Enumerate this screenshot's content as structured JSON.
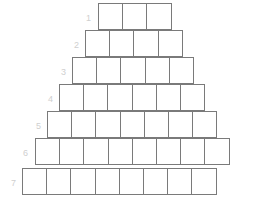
{
  "figure": {
    "kind": "brick-pyramid-grid",
    "background_color": "#ffffff",
    "cell_border_color": "#7a7a7a",
    "label_color": "#cfcfcf",
    "cell_width": 25.2,
    "cell_height": 27,
    "total_rows": 7,
    "total_cells": 41
  },
  "rows": [
    {
      "label": "1",
      "cells": 3,
      "left": 98,
      "top": 3,
      "label_x": 86,
      "label_y": 14
    },
    {
      "label": "2",
      "cells": 4,
      "left": 85,
      "top": 30,
      "label_x": 74,
      "label_y": 41
    },
    {
      "label": "3",
      "cells": 5,
      "left": 72,
      "top": 57,
      "label_x": 61,
      "label_y": 68
    },
    {
      "label": "4",
      "cells": 6,
      "left": 59,
      "top": 84,
      "label_x": 48,
      "label_y": 95
    },
    {
      "label": "5",
      "cells": 7,
      "left": 47,
      "top": 111,
      "label_x": 36,
      "label_y": 122
    },
    {
      "label": "6",
      "cells": 8,
      "left": 35,
      "top": 138,
      "label_x": 23,
      "label_y": 149
    },
    {
      "label": "7",
      "cells": 8,
      "left": 22,
      "top": 168,
      "label_x": 11,
      "label_y": 179
    }
  ]
}
